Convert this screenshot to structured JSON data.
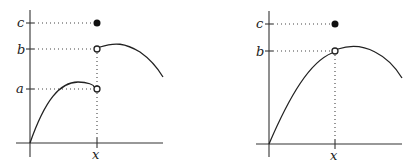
{
  "figure": {
    "panels": [
      {
        "id": "left",
        "description": "Function with jump discontinuity at x; left limit a, right limit b, value c",
        "y_labels": {
          "c": "c",
          "b": "b",
          "a": "a"
        },
        "x_label": "x",
        "points": [
          {
            "label": "c",
            "type": "filled",
            "meaning": "f(x) = c"
          },
          {
            "label": "b",
            "type": "open",
            "meaning": "right-hand limit"
          },
          {
            "label": "a",
            "type": "open",
            "meaning": "left-hand limit"
          }
        ]
      },
      {
        "id": "right",
        "description": "Function with removable discontinuity at x; limit b, value c",
        "y_labels": {
          "c": "c",
          "b": "b"
        },
        "x_label": "x",
        "points": [
          {
            "label": "c",
            "type": "filled",
            "meaning": "f(x) = c"
          },
          {
            "label": "b",
            "type": "open",
            "meaning": "limit"
          }
        ]
      }
    ]
  }
}
